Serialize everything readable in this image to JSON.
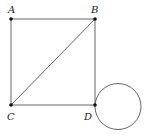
{
  "diagram": {
    "colors": {
      "line": "#555555",
      "point": "#111111",
      "label": "#222222",
      "background": "#ffffff"
    },
    "points": [
      {
        "id": "A",
        "label": "A",
        "x": 11,
        "y": 19,
        "label_x": 8,
        "label_y": 13
      },
      {
        "id": "B",
        "label": "B",
        "x": 95,
        "y": 19,
        "label_x": 91,
        "label_y": 13
      },
      {
        "id": "C",
        "label": "C",
        "x": 11,
        "y": 105,
        "label_x": 7,
        "label_y": 120
      },
      {
        "id": "D",
        "label": "D",
        "x": 95,
        "y": 105,
        "label_x": 84,
        "label_y": 120
      }
    ],
    "segments": [
      {
        "from": "A",
        "to": "B"
      },
      {
        "from": "B",
        "to": "D"
      },
      {
        "from": "D",
        "to": "C"
      },
      {
        "from": "C",
        "to": "A"
      },
      {
        "from": "C",
        "to": "B"
      }
    ],
    "circle": {
      "cx": 118,
      "cy": 106.5,
      "r": 23,
      "passes_through": "D"
    }
  }
}
